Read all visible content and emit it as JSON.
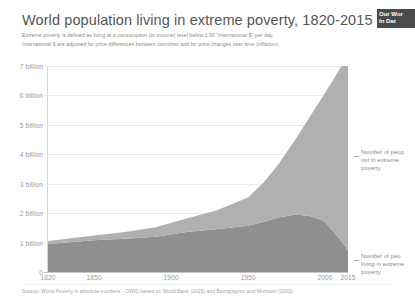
{
  "header": {
    "title": "World population living in extreme poverty, 1820-2015",
    "subtitle_line1": "Extreme poverty is defined as living at a consumption (or income) level below 1.90 \"international $\" per day.",
    "subtitle_line2": "International $ are adjusted for price differences between countries and for price changes over time (inflation)."
  },
  "logo": {
    "line1": "Our Wor",
    "line2": "In Dat",
    "full_name": "Our World in Data",
    "background": "#4a4a4a"
  },
  "annotations": {
    "upper": {
      "line1": "Number of peop",
      "line2": "not in extreme",
      "line3": "poverty",
      "full": "Number of people not in extreme poverty"
    },
    "lower": {
      "line1": "Number of peo",
      "line2": "living in extreme",
      "line3": "poverty",
      "full": "Number of people living in extreme poverty"
    }
  },
  "source": {
    "text": "Source: World Poverty in absolute numbers - OWID based on World Bank (2016) and Bourguignon and Morrison (2002)"
  },
  "colors": {
    "not_in_poverty": "#b0b0b0",
    "in_poverty": "#8f8f8f",
    "gridline": "#ebebeb",
    "text_muted": "#9a9a9a",
    "title": "#555555"
  },
  "chart_data": {
    "type": "area",
    "stacked": true,
    "title": "World population living in extreme poverty, 1820-2015",
    "xlabel": "",
    "ylabel": "",
    "xlim": [
      1820,
      2015
    ],
    "ylim": [
      0,
      7000000000
    ],
    "grid": true,
    "legend_position": "right-inline-annotations",
    "ytick_labels": [
      "0",
      "1 billion",
      "2 billion",
      "3 billion",
      "4 billion",
      "5 billion",
      "6 billion",
      "7 billion"
    ],
    "ytick_values": [
      0,
      1000000000,
      2000000000,
      3000000000,
      4000000000,
      5000000000,
      6000000000,
      7000000000
    ],
    "xtick_labels": [
      "1820",
      "1850",
      "1900",
      "1950",
      "2000",
      "2015"
    ],
    "xtick_values": [
      1820,
      1850,
      1900,
      1950,
      2000,
      2015
    ],
    "x": [
      1820,
      1850,
      1870,
      1890,
      1910,
      1929,
      1950,
      1960,
      1970,
      1981,
      1990,
      1999,
      2005,
      2010,
      2015
    ],
    "series": [
      {
        "name": "Number of people living in extreme poverty",
        "color": "#8f8f8f",
        "values_billion": [
          0.95,
          1.08,
          1.13,
          1.2,
          1.36,
          1.45,
          1.57,
          1.7,
          1.85,
          1.95,
          1.9,
          1.75,
          1.4,
          1.1,
          0.73
        ]
      },
      {
        "name": "Number of people not in extreme poverty",
        "color": "#b0b0b0",
        "values_billion": [
          0.1,
          0.16,
          0.23,
          0.32,
          0.46,
          0.63,
          0.96,
          1.33,
          1.83,
          2.57,
          3.36,
          4.25,
          5.1,
          5.83,
          6.61
        ]
      }
    ],
    "total_billion": [
      1.05,
      1.24,
      1.36,
      1.52,
      1.82,
      2.08,
      2.53,
      3.03,
      3.68,
      4.52,
      5.26,
      6.0,
      6.5,
      6.93,
      7.34
    ]
  }
}
